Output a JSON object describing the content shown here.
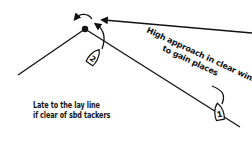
{
  "diagram": {
    "labels": {
      "high_approach_line1": "High approach in clear wind",
      "high_approach_line2": "to gain places",
      "late_layline_line1": "Late to the lay line",
      "late_layline_line2": "if clear of sbd tackers"
    },
    "boats": [
      {
        "id": "1",
        "label": "1",
        "description": "boat on high approach"
      },
      {
        "id": "2",
        "label": "2",
        "description": "boat late to lay line"
      }
    ],
    "mark": {
      "label": "windward mark"
    },
    "colors": {
      "ink": "#111111",
      "background": "#ffffff"
    }
  }
}
